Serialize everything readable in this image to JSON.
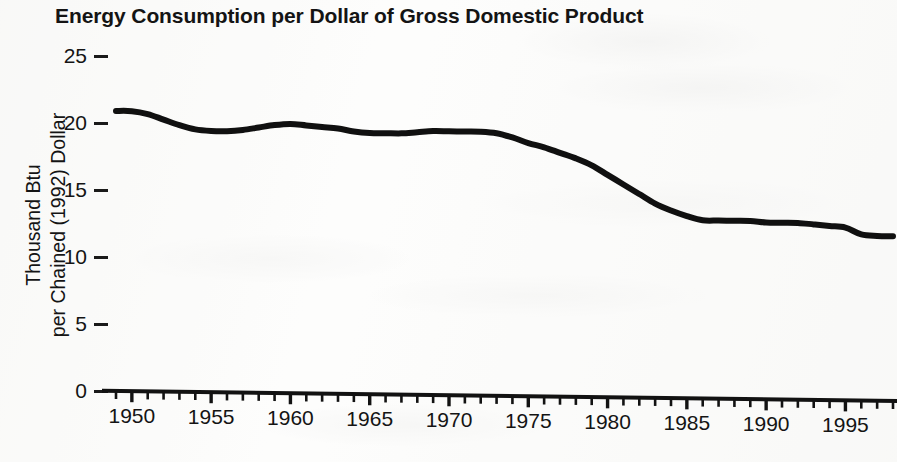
{
  "chart_data": {
    "type": "line",
    "title": "Energy Consumption per Dollar of Gross Domestic Product",
    "ylabel_line1": "Thousand Btu",
    "ylabel_line2": "per Chained (1992) Dollar",
    "xlabel": "",
    "xlim": [
      1949,
      1998
    ],
    "ylim": [
      0,
      25
    ],
    "ytick_values": [
      25,
      20,
      15,
      10,
      5,
      0
    ],
    "ytick_labels": [
      "25",
      "20",
      "15",
      "10",
      "5",
      "0"
    ],
    "xtick_labels": [
      "1950",
      "1955",
      "1960",
      "1965",
      "1970",
      "1975",
      "1980",
      "1985",
      "1990",
      "1995"
    ],
    "xtick_values": [
      1950,
      1955,
      1960,
      1965,
      1970,
      1975,
      1980,
      1985,
      1990,
      1995
    ],
    "minor_xticks_every": 1,
    "grid": false,
    "legend": "none",
    "line_color": "#101010",
    "line_width_px": 6,
    "x": [
      1949,
      1950,
      1951,
      1952,
      1953,
      1954,
      1955,
      1956,
      1957,
      1958,
      1959,
      1960,
      1961,
      1962,
      1963,
      1964,
      1965,
      1966,
      1967,
      1968,
      1969,
      1970,
      1971,
      1972,
      1973,
      1974,
      1975,
      1976,
      1977,
      1978,
      1979,
      1980,
      1981,
      1982,
      1983,
      1984,
      1985,
      1986,
      1987,
      1988,
      1989,
      1990,
      1991,
      1992,
      1993,
      1994,
      1995,
      1996,
      1997,
      1998
    ],
    "values": [
      20.9,
      20.9,
      20.7,
      20.3,
      19.9,
      19.6,
      19.5,
      19.5,
      19.6,
      19.8,
      20.0,
      20.1,
      20.0,
      19.9,
      19.8,
      19.6,
      19.5,
      19.5,
      19.5,
      19.6,
      19.7,
      19.7,
      19.7,
      19.7,
      19.6,
      19.3,
      18.9,
      18.6,
      18.2,
      17.8,
      17.3,
      16.6,
      15.9,
      15.2,
      14.5,
      14.0,
      13.6,
      13.3,
      13.3,
      13.3,
      13.3,
      13.2,
      13.2,
      13.2,
      13.1,
      13.0,
      12.9,
      12.4,
      12.3,
      12.3
    ],
    "series_name": "Energy consumption per dollar of GDP"
  }
}
